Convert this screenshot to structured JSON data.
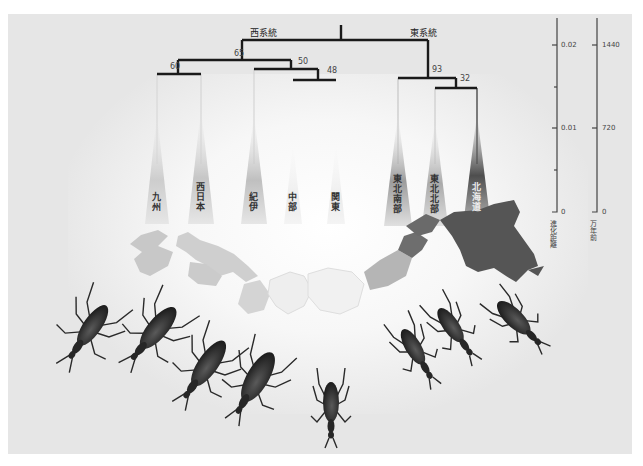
{
  "figure": {
    "clades": {
      "west": "西系統",
      "east": "東系統"
    },
    "bootstrap": {
      "west_root": "65",
      "kyushu_west": "60",
      "kii_group": "50",
      "chubu_kanto": "48",
      "east_root": "93",
      "tohoku_hokkaido": "32"
    },
    "leaves": [
      {
        "id": "kyushu",
        "label": "九州",
        "shade": "#c9c9c9"
      },
      {
        "id": "nishinihon",
        "label": "西日本",
        "shade": "#c4c4c4"
      },
      {
        "id": "kii",
        "label": "紀伊",
        "shade": "#bdbdbd"
      },
      {
        "id": "chubu",
        "label": "中部",
        "shade": "#e0e0e0"
      },
      {
        "id": "kanto",
        "label": "関東",
        "shade": "#dadada"
      },
      {
        "id": "tohoku_nanbu",
        "label": "東北南部",
        "shade": "#9a9a9a"
      },
      {
        "id": "tohoku_hokubu",
        "label": "東北北部",
        "shade": "#a8a8a8"
      },
      {
        "id": "hokkaido",
        "label": "北海道",
        "shade": "#555555"
      }
    ],
    "axes": {
      "distance": {
        "title": "進化距離",
        "ticks": [
          "0.02",
          "0.01",
          "0"
        ]
      },
      "time": {
        "title": "万年前",
        "ticks": [
          "1440",
          "720",
          "0"
        ]
      }
    },
    "map_colors": {
      "kyushu": "#c8c8c8",
      "west_honshu": "#cfcfcf",
      "kii": "#d6d6d6",
      "chubu": "#efefef",
      "kanto": "#f2f2f2",
      "tohoku_south": "#b5b5b5",
      "tohoku_north": "#6e6e6e",
      "hokkaido": "#555555"
    },
    "beetle_count": 8
  }
}
